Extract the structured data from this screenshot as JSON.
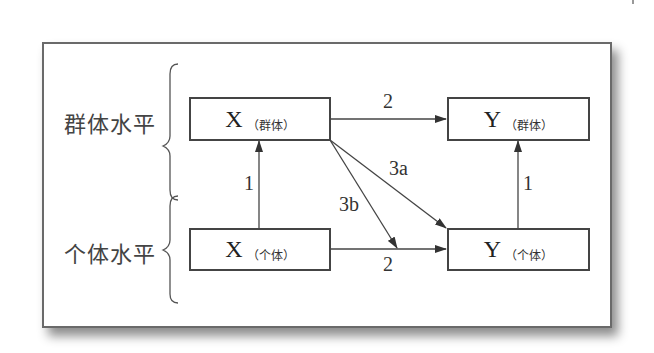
{
  "diagram": {
    "levels": [
      {
        "label": "群体水平"
      },
      {
        "label": "个体水平"
      }
    ],
    "boxes": {
      "x_group": {
        "var": "X",
        "sub": "（群体）"
      },
      "y_group": {
        "var": "Y",
        "sub": "（群体）"
      },
      "x_indiv": {
        "var": "X",
        "sub": "（个体）"
      },
      "y_indiv": {
        "var": "Y",
        "sub": "（个体）"
      }
    },
    "paths": {
      "group_xy": "2",
      "indiv_xy": "2",
      "x_up": "1",
      "y_up": "1",
      "p3a": "3a",
      "p3b": "3b"
    },
    "edges": [
      {
        "from": "x_group",
        "to": "y_group",
        "label": "2"
      },
      {
        "from": "x_indiv",
        "to": "y_indiv",
        "label": "2"
      },
      {
        "from": "x_indiv",
        "to": "x_group",
        "label": "1"
      },
      {
        "from": "y_indiv",
        "to": "y_group",
        "label": "1"
      },
      {
        "from": "x_group",
        "to": "y_indiv",
        "label": "3a"
      },
      {
        "from": "x_group",
        "to": "indiv_xy_path",
        "label": "3b"
      }
    ]
  }
}
